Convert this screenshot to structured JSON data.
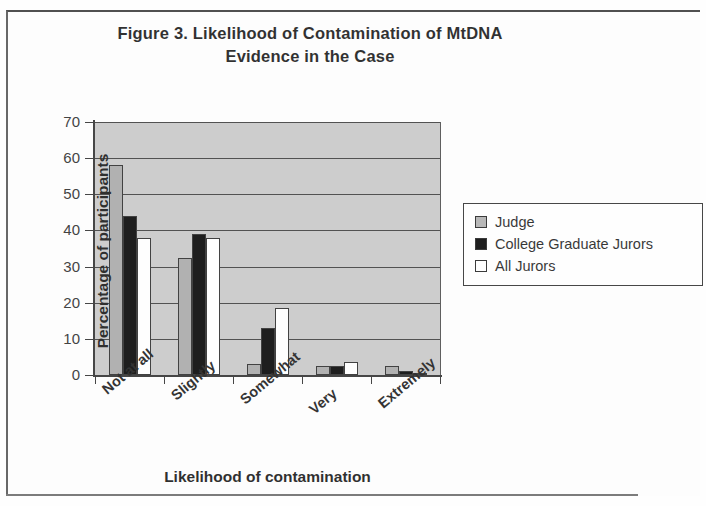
{
  "chart_data": {
    "type": "bar",
    "title": "Figure 3. Likelihood of Contamination of MtDNA Evidence in the Case",
    "title_line1": "Figure 3. Likelihood of Contamination of MtDNA",
    "title_line2": "Evidence in the Case",
    "xlabel": "Likelihood of contamination",
    "ylabel": "Percentage of participants",
    "ylim": [
      0,
      70
    ],
    "ytick_step": 10,
    "yticks": [
      70,
      60,
      50,
      40,
      30,
      20,
      10,
      0
    ],
    "grid": true,
    "legend_position": "right",
    "categories": [
      "Not at all",
      "Slightly",
      "Somewhat",
      "Very",
      "Extremely"
    ],
    "series": [
      {
        "name": "Judge",
        "color": "#a8a8a8",
        "values": [
          58,
          32.5,
          3,
          2.5,
          2.5
        ]
      },
      {
        "name": "College Graduate Jurors",
        "color": "#000000",
        "values": [
          44,
          39,
          13,
          2.5,
          1
        ]
      },
      {
        "name": "All Jurors",
        "color": "#ffffff",
        "values": [
          38,
          38,
          18.5,
          3.5,
          0.5
        ]
      }
    ],
    "plot_background": "#c8c8c8"
  },
  "legend": {
    "items": [
      {
        "label": "Judge"
      },
      {
        "label": "College Graduate Jurors"
      },
      {
        "label": "All Jurors"
      }
    ]
  }
}
